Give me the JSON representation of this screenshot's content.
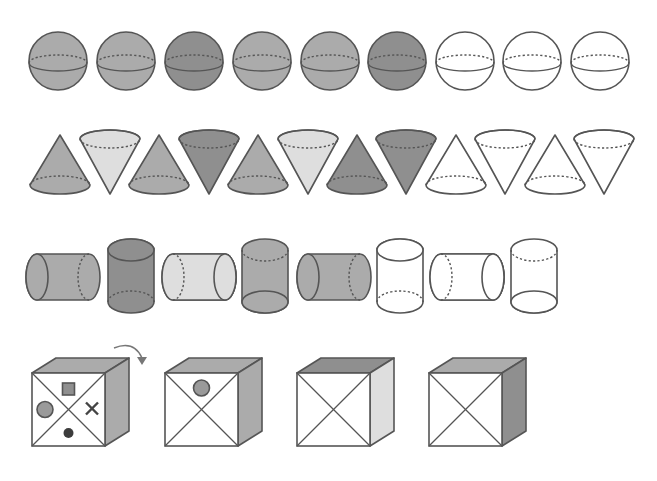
{
  "header": {
    "cutoff_text": ""
  },
  "colors": {
    "outline": "#555555",
    "gray": "#ababab",
    "dark": "#8f8f8f",
    "light": "#dedede",
    "white": "#ffffff",
    "marker_dark": "#3c3c3c"
  },
  "rows": {
    "spheres": [
      {
        "fill": "gray"
      },
      {
        "fill": "gray"
      },
      {
        "fill": "dark"
      },
      {
        "fill": "gray"
      },
      {
        "fill": "gray"
      },
      {
        "fill": "dark"
      },
      {
        "fill": "white"
      },
      {
        "fill": "white"
      },
      {
        "fill": "white"
      }
    ],
    "cones": [
      {
        "dir": "up",
        "fill": "gray"
      },
      {
        "dir": "down",
        "fill": "light"
      },
      {
        "dir": "up",
        "fill": "gray"
      },
      {
        "dir": "down",
        "fill": "dark"
      },
      {
        "dir": "up",
        "fill": "gray"
      },
      {
        "dir": "down",
        "fill": "light"
      },
      {
        "dir": "up",
        "fill": "dark"
      },
      {
        "dir": "down",
        "fill": "dark"
      },
      {
        "dir": "up",
        "fill": "white"
      },
      {
        "dir": "down",
        "fill": "white"
      },
      {
        "dir": "up",
        "fill": "white"
      },
      {
        "dir": "down",
        "fill": "white"
      }
    ],
    "cylinders": [
      {
        "orient": "horizontal",
        "cap": "left",
        "fill": "gray"
      },
      {
        "orient": "vertical",
        "cap": "top",
        "fill": "dark"
      },
      {
        "orient": "horizontal",
        "cap": "right",
        "fill": "light"
      },
      {
        "orient": "vertical",
        "cap": "bottom",
        "fill": "gray"
      },
      {
        "orient": "horizontal",
        "cap": "left",
        "fill": "gray"
      },
      {
        "orient": "vertical",
        "cap": "top",
        "fill": "white"
      },
      {
        "orient": "horizontal",
        "cap": "right",
        "fill": "white"
      },
      {
        "orient": "vertical",
        "cap": "bottom",
        "fill": "white"
      }
    ],
    "cubes": [
      {
        "top": "gray",
        "side": "gray",
        "front_marks": [
          "square-top",
          "circle-left",
          "cross-right",
          "dot-bottom"
        ],
        "rotation_arrow": true
      },
      {
        "top": "gray",
        "side": "gray",
        "front_marks": [
          "circle-top"
        ],
        "rotation_arrow": false
      },
      {
        "top": "dark",
        "side": "light",
        "front_marks": [],
        "rotation_arrow": false
      },
      {
        "top": "gray",
        "side": "dark",
        "front_marks": [],
        "rotation_arrow": false
      }
    ]
  }
}
